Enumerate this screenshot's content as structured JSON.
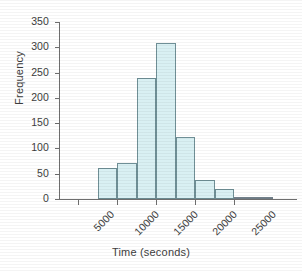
{
  "chart_data": {
    "type": "bar",
    "title": "",
    "xlabel": "Time (seconds)",
    "ylabel": "Frequency",
    "grid": false,
    "legend": null,
    "xlim": [
      5000,
      28000
    ],
    "ylim": [
      0,
      350
    ],
    "bin_width": 2500,
    "x_tick_labels": [
      "5000",
      "10000",
      "15000",
      "20000",
      "25000"
    ],
    "x_tick_values": [
      5000,
      10000,
      15000,
      20000,
      25000
    ],
    "y_tick_labels": [
      "0",
      "50",
      "100",
      "150",
      "200",
      "250",
      "300",
      "350"
    ],
    "y_tick_values": [
      0,
      50,
      100,
      150,
      200,
      250,
      300,
      350
    ],
    "bins": [
      {
        "start": 7500,
        "end": 10000,
        "value": 62
      },
      {
        "start": 10000,
        "end": 12500,
        "value": 72
      },
      {
        "start": 12500,
        "end": 15000,
        "value": 240
      },
      {
        "start": 15000,
        "end": 17500,
        "value": 308
      },
      {
        "start": 17500,
        "end": 20000,
        "value": 123
      },
      {
        "start": 20000,
        "end": 22500,
        "value": 38
      },
      {
        "start": 22500,
        "end": 25000,
        "value": 19
      },
      {
        "start": 25000,
        "end": 27500,
        "value": 3
      },
      {
        "start": 27500,
        "end": 30000,
        "value": 1
      }
    ],
    "categories": [
      "7500-10000",
      "10000-12500",
      "12500-15000",
      "15000-17500",
      "17500-20000",
      "20000-22500",
      "22500-25000",
      "25000-27500",
      "27500-30000"
    ],
    "values": [
      62,
      72,
      240,
      308,
      123,
      38,
      19,
      3,
      1
    ],
    "colors": {
      "bar_fill": "#d9f0f3",
      "bar_border": "#6f8f96",
      "axis": "#6e6e6e",
      "text": "#3d3d3d",
      "background": "#ffffff"
    }
  }
}
